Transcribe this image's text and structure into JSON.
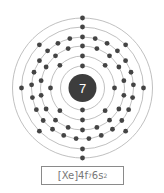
{
  "diagram": {
    "type": "bohr-atom-model",
    "nucleus_label": "7",
    "center": [
      82.5,
      88
    ],
    "nucleus_radius": 14,
    "shells": [
      {
        "radius": 22,
        "electrons": 2
      },
      {
        "radius": 32,
        "electrons": 8
      },
      {
        "radius": 42,
        "electrons": 18
      },
      {
        "radius": 51,
        "electrons": 25
      },
      {
        "radius": 61,
        "electrons": 8
      },
      {
        "radius": 70,
        "electrons": 2
      }
    ],
    "colors": {
      "ring": "#b0b0b0",
      "electron": "#444444",
      "nucleus": "#3d3d3d",
      "nucleus_text": "#ffffff"
    }
  },
  "config": {
    "core": "[Xe]",
    "part1": "4f",
    "sup1": "7",
    "part2": "6s",
    "sup2": "2"
  }
}
